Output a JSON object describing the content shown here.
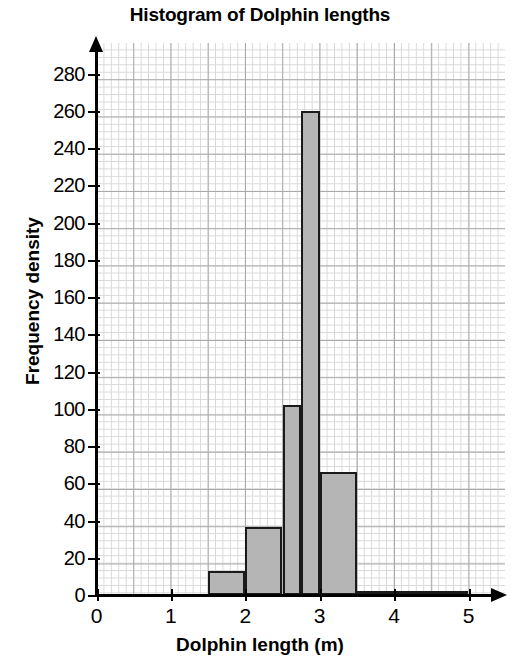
{
  "chart_data": {
    "type": "bar",
    "title": "Histogram of Dolphin lengths",
    "xlabel": "Dolphin length (m)",
    "ylabel": "Frequency density",
    "xlim": [
      0,
      5
    ],
    "ylim": [
      0,
      290
    ],
    "grid": "graph-paper minor 0.05 units, major every 5 minor",
    "legend": "none",
    "bar_fill_color": "#b5b5b5",
    "bar_edge_color": "#1a1a1a",
    "xticks": [
      "0",
      "1",
      "2",
      "3",
      "4",
      "5"
    ],
    "xtick_values": [
      0,
      1,
      2,
      3,
      4,
      5
    ],
    "yticks": [
      "0",
      "20",
      "40",
      "60",
      "80",
      "100",
      "120",
      "140",
      "160",
      "180",
      "200",
      "220",
      "240",
      "260",
      "280"
    ],
    "ytick_values": [
      0,
      20,
      40,
      60,
      80,
      100,
      120,
      140,
      160,
      180,
      200,
      220,
      240,
      260,
      280
    ],
    "bins": [
      {
        "label": "1.5-2.0",
        "x0": 1.5,
        "x1": 2.0,
        "value": 13
      },
      {
        "label": "2.0-2.5",
        "x0": 2.0,
        "x1": 2.5,
        "value": 36.5
      },
      {
        "label": "2.5-2.75",
        "x0": 2.5,
        "x1": 2.75,
        "value": 102
      },
      {
        "label": "2.75-3.0",
        "x0": 2.75,
        "x1": 3.0,
        "value": 260
      },
      {
        "label": "3.0-3.5",
        "x0": 3.0,
        "x1": 3.5,
        "value": 66
      },
      {
        "label": "3.5-5.0",
        "x0": 3.5,
        "x1": 5.0,
        "value": 2
      }
    ],
    "categories": [
      "1.5-2.0",
      "2.0-2.5",
      "2.5-2.75",
      "2.75-3.0",
      "3.0-3.5",
      "3.5-5.0"
    ],
    "values": [
      13,
      36.5,
      102,
      260,
      66,
      2
    ]
  }
}
